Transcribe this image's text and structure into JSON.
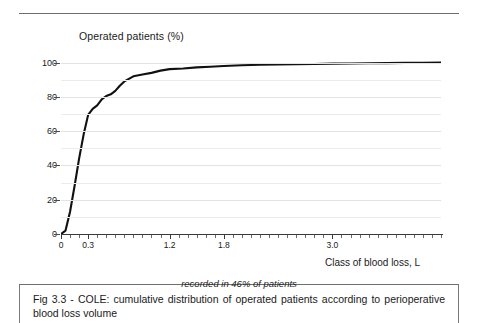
{
  "figure": {
    "caption": "Fig 3.3 - COLE: cumulative distribution of operated patients according to perioperative blood loss volume",
    "subnote": "recorded in 46% of  patients"
  },
  "chart_data": {
    "type": "line",
    "title": "",
    "ylabel": "Operated patients (%)",
    "xlabel": "Class of blood loss, L",
    "xlim": [
      0,
      4.2
    ],
    "ylim": [
      0,
      105
    ],
    "grid": true,
    "legend": "none",
    "y_ticks": [
      {
        "value": 100,
        "label": "100"
      },
      {
        "value": 80,
        "label": "80"
      },
      {
        "value": 60,
        "label": "60"
      },
      {
        "value": 40,
        "label": "40"
      },
      {
        "value": 20,
        "label": "20"
      },
      {
        "value": 0,
        "label": "0"
      }
    ],
    "y_minor_ticks": [
      90,
      70,
      50,
      30,
      10
    ],
    "x_ticks": [
      {
        "value": 0,
        "label": "0"
      },
      {
        "value": 0.3,
        "label": "0.3"
      },
      {
        "value": 1.2,
        "label": "1.2"
      },
      {
        "value": 1.8,
        "label": "1.8"
      },
      {
        "value": 3.0,
        "label": "3.0"
      }
    ],
    "x_minor_tick_step": 0.1,
    "series": [
      {
        "name": "Cumulative % of operated patients",
        "color": "#111111",
        "x": [
          0.0,
          0.05,
          0.1,
          0.15,
          0.2,
          0.25,
          0.3,
          0.35,
          0.4,
          0.45,
          0.5,
          0.55,
          0.6,
          0.65,
          0.7,
          0.75,
          0.8,
          0.9,
          1.0,
          1.1,
          1.2,
          1.35,
          1.5,
          1.65,
          1.8,
          2.0,
          2.2,
          2.4,
          2.6,
          2.8,
          3.0,
          3.2,
          3.4,
          3.6,
          3.8,
          4.0,
          4.2
        ],
        "y": [
          0.0,
          2.0,
          13.0,
          28.0,
          44.0,
          58.0,
          69.5,
          73.0,
          75.0,
          78.5,
          80.5,
          81.5,
          83.5,
          86.5,
          89.0,
          90.5,
          92.0,
          93.0,
          94.0,
          95.3,
          96.2,
          96.5,
          97.2,
          97.6,
          98.0,
          98.4,
          98.7,
          98.9,
          99.1,
          99.2,
          99.4,
          99.5,
          99.6,
          99.7,
          99.8,
          99.9,
          100.0
        ]
      }
    ]
  }
}
